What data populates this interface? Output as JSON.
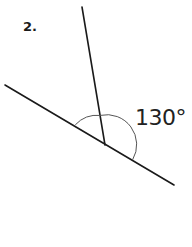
{
  "problem": {
    "number": "2."
  },
  "figure": {
    "angle_label": "130°",
    "angle_degrees": 130,
    "line_color": "#1a1a1a",
    "arc_color": "#555555",
    "vertex": [
      105,
      145
    ],
    "base_line": {
      "start": [
        5,
        85
      ],
      "end": [
        174,
        185
      ]
    },
    "ray": {
      "start": [
        105,
        145
      ],
      "end": [
        82,
        7
      ]
    },
    "arc_radius": 30
  }
}
